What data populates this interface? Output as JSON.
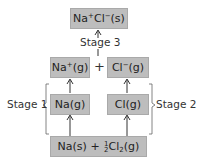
{
  "diagram": {
    "type": "born-haber-cycle",
    "nodes": {
      "product": {
        "base1": "Na",
        "sup1": "+",
        "base2": "Cl",
        "sup2": "−",
        "state": "(s)"
      },
      "na_ion": {
        "base": "Na",
        "sup": "+",
        "state": "(g)"
      },
      "plus": "+",
      "cl_ion": {
        "base": "Cl",
        "sup": "−",
        "state": "(g)"
      },
      "na_gas": "Na(g)",
      "cl_gas": "Cl(g)",
      "reactants": {
        "part1": "Na(s) + ",
        "frac_num": "1",
        "frac_den": "2",
        "cl": "Cl",
        "sub": "2",
        "state": "(g)"
      }
    },
    "labels": {
      "stage1": "Stage 1",
      "stage2": "Stage 2",
      "stage3": "Stage 3"
    },
    "colors": {
      "box_fill": "#bdbdbd",
      "line": "#333333"
    }
  }
}
